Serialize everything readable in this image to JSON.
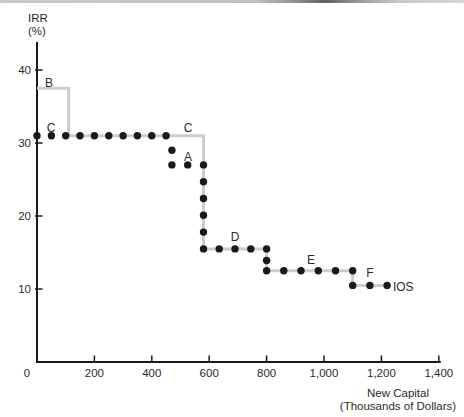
{
  "figure": {
    "y_axis_title": [
      "IRR",
      "(%)"
    ],
    "x_axis_title": [
      "New Capital",
      "(Thousands of Dollars)"
    ],
    "colors": {
      "gray_step_line": "#cdcdcd",
      "dot_black": "#1a1a1a",
      "axis": "#1a1a1a",
      "text": "#2b2b2b"
    }
  },
  "chart_data": {
    "type": "line",
    "title": "",
    "xlabel": "New Capital (Thousands of Dollars)",
    "ylabel": "IRR (%)",
    "xlim": [
      0,
      1400
    ],
    "ylim": [
      0,
      45
    ],
    "grid": false,
    "x_ticks": [
      0,
      200,
      400,
      600,
      800,
      1000,
      1200,
      1400
    ],
    "x_tick_labels": [
      "0",
      "200",
      "400",
      "600",
      "800",
      "1,000",
      "1,200",
      "1,400"
    ],
    "y_ticks": [
      10,
      20,
      30,
      40
    ],
    "y_tick_labels": [
      "10",
      "20",
      "30",
      "40"
    ],
    "projects": [
      {
        "label": "B",
        "irr": 37.5,
        "capital_from": 0,
        "capital_to": 110,
        "on_line": "gray"
      },
      {
        "label": "C",
        "irr": 31.0,
        "capital_from": 110,
        "capital_to": 580,
        "on_line": "gray-and-dotted"
      },
      {
        "label": "A",
        "irr": 27.0,
        "capital_from": 470,
        "capital_to": 580,
        "on_line": "dotted"
      },
      {
        "label": "D",
        "irr": 15.5,
        "capital_from": 580,
        "capital_to": 800,
        "on_line": "both"
      },
      {
        "label": "E",
        "irr": 12.5,
        "capital_from": 800,
        "capital_to": 1100,
        "on_line": "both"
      },
      {
        "label": "F",
        "irr": 10.5,
        "capital_from": 1100,
        "capital_to": 1220,
        "on_line": "both"
      }
    ],
    "series": [
      {
        "name": "IOS step schedule with project B (gray solid line)",
        "style": "solid-gray",
        "points": [
          [
            0,
            37.5
          ],
          [
            110,
            37.5
          ],
          [
            110,
            31
          ],
          [
            580,
            31
          ],
          [
            580,
            15.5
          ],
          [
            800,
            15.5
          ],
          [
            800,
            12.5
          ],
          [
            1100,
            12.5
          ],
          [
            1100,
            10.5
          ],
          [
            1220,
            10.5
          ]
        ]
      },
      {
        "name": "IOS step schedule with project A (black dotted line, labeled IOS)",
        "style": "black-dots",
        "points": [
          [
            0,
            31
          ],
          [
            470,
            31
          ],
          [
            470,
            27
          ],
          [
            580,
            27
          ],
          [
            580,
            15.5
          ],
          [
            800,
            15.5
          ],
          [
            800,
            12.5
          ],
          [
            1100,
            12.5
          ],
          [
            1100,
            10.5
          ],
          [
            1220,
            10.5
          ]
        ]
      }
    ],
    "dotted_points": [
      [
        0,
        31
      ],
      [
        50,
        31
      ],
      [
        100,
        31
      ],
      [
        150,
        31
      ],
      [
        200,
        31
      ],
      [
        250,
        31
      ],
      [
        300,
        31
      ],
      [
        350,
        31
      ],
      [
        400,
        31
      ],
      [
        450,
        31
      ],
      [
        470,
        29
      ],
      [
        470,
        27
      ],
      [
        525,
        27
      ],
      [
        580,
        27
      ],
      [
        580,
        24.7
      ],
      [
        580,
        22.4
      ],
      [
        580,
        20.1
      ],
      [
        580,
        17.8
      ],
      [
        580,
        15.5
      ],
      [
        635,
        15.5
      ],
      [
        690,
        15.5
      ],
      [
        745,
        15.5
      ],
      [
        800,
        15.5
      ],
      [
        800,
        13.9
      ],
      [
        800,
        12.5
      ],
      [
        860,
        12.5
      ],
      [
        920,
        12.5
      ],
      [
        980,
        12.5
      ],
      [
        1040,
        12.5
      ],
      [
        1100,
        12.5
      ],
      [
        1100,
        10.5
      ],
      [
        1160,
        10.5
      ],
      [
        1220,
        10.5
      ]
    ],
    "annotations": [
      {
        "text": "B",
        "x": 42,
        "y": 37.7,
        "anchor": "middle"
      },
      {
        "text": "C",
        "x": 49,
        "y": 31.5,
        "anchor": "middle"
      },
      {
        "text": "C",
        "x": 526,
        "y": 31.5,
        "anchor": "middle"
      },
      {
        "text": "A",
        "x": 526,
        "y": 27.5,
        "anchor": "middle"
      },
      {
        "text": "D",
        "x": 690,
        "y": 16.6,
        "anchor": "middle"
      },
      {
        "text": "E",
        "x": 955,
        "y": 13.4,
        "anchor": "middle"
      },
      {
        "text": "F",
        "x": 1160,
        "y": 11.6,
        "anchor": "middle"
      },
      {
        "text": "IOS",
        "x": 1240,
        "y": 9.7,
        "anchor": "start"
      }
    ],
    "legend_position": "none"
  }
}
